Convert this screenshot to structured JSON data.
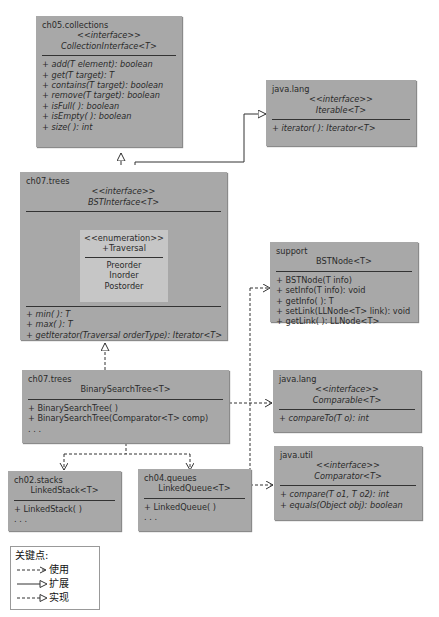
{
  "boxes": {
    "collection": {
      "package": "ch05.collections",
      "stereotype": "<<interface>>",
      "name": "CollectionInterface<T>",
      "ops": [
        "+ add(T element): boolean",
        "+ get(T target): T",
        "+ contains(T target): boolean",
        "+ remove(T target): boolean",
        "+ isFull( ): boolean",
        "+ isEmpty( ): boolean",
        "+ size( ): int"
      ]
    },
    "iterable": {
      "package": "java.lang",
      "stereotype": "<<interface>>",
      "name": "Iterable<T>",
      "ops": [
        "+ iterator( ): Iterator<T>"
      ]
    },
    "bstinterface": {
      "package": "ch07.trees",
      "stereotype": "<<interface>>",
      "name": "BSTInterface<T>",
      "enum": {
        "stereotype": "<<enumeration>>",
        "name": "+Traversal",
        "values": [
          "Preorder",
          "Inorder",
          "Postorder"
        ]
      },
      "ops": [
        "+ min( ): T",
        "+ max( ): T",
        "+ getIterator(Traversal orderType): Iterator<T>"
      ]
    },
    "bstnode": {
      "package": "support",
      "name": "BSTNode<T>",
      "ops": [
        "+ BSTNode(T info)",
        "+ setInfo(T info): void",
        "+ getInfo( ): T",
        "+ setLink(LLNode<T> link): void",
        "+ getLink( ): LLNode<T>"
      ]
    },
    "bst": {
      "package": "ch07.trees",
      "name": "BinarySearchTree<T>",
      "ops": [
        "+ BinarySearchTree( )",
        "+ BinarySearchTree(Comparator<T> comp)",
        ". . ."
      ]
    },
    "comparable": {
      "package": "java.lang",
      "stereotype": "<<interface>>",
      "name": "Comparable<T>",
      "ops": [
        "+ compareTo(T o): int"
      ]
    },
    "comparator": {
      "package": "java.util",
      "stereotype": "<<interface>>",
      "name": "Comparator<T>",
      "ops": [
        "+ compare(T o1, T o2): int",
        "+ equals(Object obj): boolean"
      ]
    },
    "linkedstack": {
      "package": "ch02.stacks",
      "name": "LinkedStack<T>",
      "ops": [
        "+ LinkedStack( )",
        ". . ."
      ]
    },
    "linkedqueue": {
      "package": "ch04.queues",
      "name": "LinkedQueue<T>",
      "ops": [
        "+ LinkedQueue( )",
        ". . ."
      ]
    }
  },
  "legend": {
    "title": "关键点:",
    "items": [
      {
        "style": "dashed-open-arrow",
        "label": "使用"
      },
      {
        "style": "solid-triangle",
        "label": "扩展"
      },
      {
        "style": "dashed-triangle",
        "label": "实现"
      }
    ]
  },
  "colors": {
    "box_fill": "#a8a8a8",
    "enum_fill": "#c6c6c6",
    "line": "#333333"
  }
}
